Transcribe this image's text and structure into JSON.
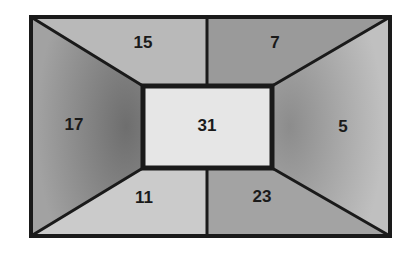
{
  "diagram": {
    "type": "frame-regions",
    "regions": [
      {
        "id": "top-left",
        "value": "15",
        "shade": "#b9b9b9"
      },
      {
        "id": "top-right",
        "value": "7",
        "shade": "#9a9a9a"
      },
      {
        "id": "left",
        "value": "17",
        "shade": "#858585"
      },
      {
        "id": "center",
        "value": "31",
        "shade": "#e6e6e6"
      },
      {
        "id": "right",
        "value": "5",
        "shade": "#a9a9a9"
      },
      {
        "id": "bottom-left",
        "value": "11",
        "shade": "#cbcbcb"
      },
      {
        "id": "bottom-right",
        "value": "23",
        "shade": "#a3a3a3"
      }
    ],
    "line_color": "#1a1a1a"
  }
}
